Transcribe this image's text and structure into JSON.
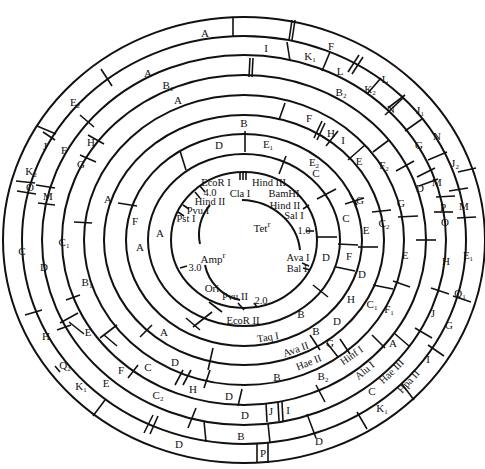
{
  "figure": {
    "type": "circular restriction map",
    "center_labels": [
      {
        "text": "Amp",
        "sup": "r",
        "x": 213,
        "y": 258
      },
      {
        "text": "Tet",
        "sup": "r",
        "x": 262,
        "y": 227
      },
      {
        "text": "Ori",
        "sup": "",
        "x": 212,
        "y": 288
      }
    ],
    "scale_marks": [
      {
        "text": "1.0",
        "x": 304,
        "y": 231
      },
      {
        "text": "2.0",
        "x": 261,
        "y": 307
      },
      {
        "text": "3.0",
        "x": 195,
        "y": 268
      },
      {
        "text": "4.0",
        "x": 210,
        "y": 193
      }
    ],
    "single_sites": [
      {
        "text": "EcoR I",
        "x": 222,
        "y": 182
      },
      {
        "text": "Hind III",
        "x": 271,
        "y": 182
      },
      {
        "text": "Cla I",
        "x": 242,
        "y": 193
      },
      {
        "text": "BamHI",
        "x": 286,
        "y": 193
      },
      {
        "text": "Hind II",
        "x": 220,
        "y": 201
      },
      {
        "text": "Hind II",
        "x": 283,
        "y": 206
      },
      {
        "text": "Pvu I",
        "x": 199,
        "y": 211
      },
      {
        "text": "Pst I",
        "x": 186,
        "y": 219
      },
      {
        "text": "Sal I",
        "x": 296,
        "y": 215
      },
      {
        "text": "Ava I",
        "x": 306,
        "y": 258
      },
      {
        "text": "Bal I",
        "x": 303,
        "y": 270
      },
      {
        "text": "Pvu II",
        "x": 233,
        "y": 296
      }
    ],
    "enzyme_rings": [
      {
        "text": "EcoR II",
        "x": 243,
        "y": 321
      },
      {
        "text": "Taq I",
        "x": 272,
        "y": 338
      },
      {
        "text": "Ava II",
        "x": 299,
        "y": 350
      },
      {
        "text": "Hae II",
        "x": 312,
        "y": 364
      },
      {
        "text": "Hinf I",
        "x": 353,
        "y": 356
      },
      {
        "text": "Alu I",
        "x": 366,
        "y": 371
      },
      {
        "text": "Hae III",
        "x": 392,
        "y": 376
      },
      {
        "text": "Hpa II",
        "x": 418,
        "y": 377
      }
    ],
    "fragments": [
      {
        "t": "A",
        "s": "",
        "x": 205,
        "y": 33
      },
      {
        "t": "I",
        "s": "",
        "x": 266,
        "y": 48
      },
      {
        "t": "F",
        "s": "",
        "x": 331,
        "y": 46
      },
      {
        "t": "K",
        "s": "1",
        "x": 310,
        "y": 57
      },
      {
        "t": "L",
        "s": "",
        "x": 340,
        "y": 71
      },
      {
        "t": "L",
        "s": "",
        "x": 385,
        "y": 79
      },
      {
        "t": "K",
        "s": "2",
        "x": 370,
        "y": 90
      },
      {
        "t": "N",
        "s": "",
        "x": 391,
        "y": 109
      },
      {
        "t": "J",
        "s": "1",
        "x": 420,
        "y": 111
      },
      {
        "t": "N",
        "s": "",
        "x": 437,
        "y": 136
      },
      {
        "t": "G",
        "s": "",
        "x": 419,
        "y": 145
      },
      {
        "t": "A",
        "s": "",
        "x": 148,
        "y": 73
      },
      {
        "t": "B",
        "s": "1",
        "x": 168,
        "y": 86
      },
      {
        "t": "B",
        "s": "2",
        "x": 341,
        "y": 93
      },
      {
        "t": "E",
        "s": "2",
        "x": 75,
        "y": 103
      },
      {
        "t": "A",
        "s": "",
        "x": 178,
        "y": 100
      },
      {
        "t": "F",
        "s": "",
        "x": 309,
        "y": 118
      },
      {
        "t": "H",
        "s": "",
        "x": 331,
        "y": 133
      },
      {
        "t": "I",
        "s": "",
        "x": 343,
        "y": 140
      },
      {
        "t": "B",
        "s": "",
        "x": 244,
        "y": 123
      },
      {
        "t": "D",
        "s": "",
        "x": 219,
        "y": 145
      },
      {
        "t": "E",
        "s": "1",
        "x": 268,
        "y": 145
      },
      {
        "t": "E",
        "s": "2",
        "x": 314,
        "y": 163
      },
      {
        "t": "E",
        "s": "",
        "x": 359,
        "y": 161
      },
      {
        "t": "F",
        "s": "2",
        "x": 384,
        "y": 166
      },
      {
        "t": "C",
        "s": "",
        "x": 316,
        "y": 173
      },
      {
        "t": "G",
        "s": "",
        "x": 360,
        "y": 200
      },
      {
        "t": "G",
        "s": "",
        "x": 401,
        "y": 203
      },
      {
        "t": "D",
        "s": "",
        "x": 420,
        "y": 188
      },
      {
        "t": "M",
        "s": "",
        "x": 437,
        "y": 182
      },
      {
        "t": "J",
        "s": "2",
        "x": 455,
        "y": 164
      },
      {
        "t": "P",
        "s": "",
        "x": 443,
        "y": 207
      },
      {
        "t": "M",
        "s": "",
        "x": 464,
        "y": 206
      },
      {
        "t": "O",
        "s": "",
        "x": 445,
        "y": 222
      },
      {
        "t": "C",
        "s": "",
        "x": 346,
        "y": 218
      },
      {
        "t": "E",
        "s": "",
        "x": 366,
        "y": 230
      },
      {
        "t": "C",
        "s": "2",
        "x": 384,
        "y": 224
      },
      {
        "t": "D",
        "s": "",
        "x": 326,
        "y": 257
      },
      {
        "t": "F",
        "s": "",
        "x": 349,
        "y": 256
      },
      {
        "t": "E",
        "s": "",
        "x": 405,
        "y": 255
      },
      {
        "t": "H",
        "s": "",
        "x": 446,
        "y": 261
      },
      {
        "t": "E",
        "s": "1",
        "x": 468,
        "y": 256
      },
      {
        "t": "D",
        "s": "",
        "x": 362,
        "y": 274
      },
      {
        "t": "H",
        "s": "",
        "x": 351,
        "y": 299
      },
      {
        "t": "C",
        "s": "1",
        "x": 372,
        "y": 305
      },
      {
        "t": "F",
        "s": "1",
        "x": 389,
        "y": 310
      },
      {
        "t": "Q",
        "s": "1",
        "x": 460,
        "y": 294
      },
      {
        "t": "J",
        "s": "",
        "x": 433,
        "y": 313
      },
      {
        "t": "G",
        "s": "",
        "x": 449,
        "y": 325
      },
      {
        "t": "B",
        "s": "",
        "x": 301,
        "y": 314
      },
      {
        "t": "B",
        "s": "",
        "x": 316,
        "y": 331
      },
      {
        "t": "D",
        "s": "",
        "x": 337,
        "y": 321
      },
      {
        "t": "G",
        "s": "",
        "x": 330,
        "y": 343
      },
      {
        "t": "A",
        "s": "",
        "x": 393,
        "y": 343
      },
      {
        "t": "I",
        "s": "",
        "x": 428,
        "y": 359
      },
      {
        "t": "B",
        "s": "",
        "x": 277,
        "y": 377
      },
      {
        "t": "B",
        "s": "2",
        "x": 323,
        "y": 377
      },
      {
        "t": "C",
        "s": "",
        "x": 372,
        "y": 391
      },
      {
        "t": "K",
        "s": "1",
        "x": 382,
        "y": 409
      },
      {
        "t": "J",
        "s": "",
        "x": 271,
        "y": 411
      },
      {
        "t": "I",
        "s": "",
        "x": 288,
        "y": 410
      },
      {
        "t": "D",
        "s": "",
        "x": 319,
        "y": 441
      },
      {
        "t": "P",
        "s": "",
        "x": 263,
        "y": 453
      },
      {
        "t": "B",
        "s": "",
        "x": 241,
        "y": 436
      },
      {
        "t": "F",
        "s": "",
        "x": 135,
        "y": 221
      },
      {
        "t": "A",
        "s": "",
        "x": 108,
        "y": 199
      },
      {
        "t": "A",
        "s": "",
        "x": 160,
        "y": 233
      },
      {
        "t": "A",
        "s": "",
        "x": 140,
        "y": 247
      },
      {
        "t": "J",
        "s": "",
        "x": 45,
        "y": 146
      },
      {
        "t": "F",
        "s": "",
        "x": 64,
        "y": 150
      },
      {
        "t": "H",
        "s": "",
        "x": 91,
        "y": 142
      },
      {
        "t": "G",
        "s": "",
        "x": 81,
        "y": 164
      },
      {
        "t": "K",
        "s": "2",
        "x": 31,
        "y": 172
      },
      {
        "t": "O",
        "s": "",
        "x": 30,
        "y": 187
      },
      {
        "t": "M",
        "s": "",
        "x": 48,
        "y": 196
      },
      {
        "t": "C",
        "s": "",
        "x": 22,
        "y": 251
      },
      {
        "t": "D",
        "s": "",
        "x": 44,
        "y": 267
      },
      {
        "t": "C",
        "s": "1",
        "x": 64,
        "y": 243
      },
      {
        "t": "B",
        "s": "1",
        "x": 87,
        "y": 283
      },
      {
        "t": "A",
        "s": "",
        "x": 164,
        "y": 332
      },
      {
        "t": "E",
        "s": "",
        "x": 88,
        "y": 332
      },
      {
        "t": "H",
        "s": "",
        "x": 46,
        "y": 336
      },
      {
        "t": "Q",
        "s": "2",
        "x": 65,
        "y": 366
      },
      {
        "t": "K",
        "s": "1",
        "x": 81,
        "y": 387
      },
      {
        "t": "E",
        "s": "",
        "x": 106,
        "y": 383
      },
      {
        "t": "F",
        "s": "",
        "x": 121,
        "y": 370
      },
      {
        "t": "C",
        "s": "",
        "x": 148,
        "y": 367
      },
      {
        "t": "D",
        "s": "",
        "x": 175,
        "y": 362
      },
      {
        "t": "C",
        "s": "2",
        "x": 158,
        "y": 396
      },
      {
        "t": "H",
        "s": "",
        "x": 193,
        "y": 389
      },
      {
        "t": "D",
        "s": "",
        "x": 245,
        "y": 415
      },
      {
        "t": "D",
        "s": "",
        "x": 229,
        "y": 396
      },
      {
        "t": "D",
        "s": "",
        "x": 179,
        "y": 444
      }
    ]
  }
}
